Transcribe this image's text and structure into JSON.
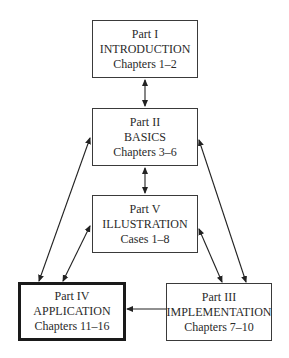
{
  "diagram": {
    "nodes": [
      {
        "id": "part1",
        "part": "Part I",
        "title": "INTRODUCTION",
        "range": "Chapters 1–2"
      },
      {
        "id": "part2",
        "part": "Part II",
        "title": "BASICS",
        "range": "Chapters 3–6"
      },
      {
        "id": "part5",
        "part": "Part V",
        "title": "ILLUSTRATION",
        "range": "Cases 1–8"
      },
      {
        "id": "part4",
        "part": "Part IV",
        "title": "APPLICATION",
        "range": "Chapters 11–16",
        "emphasized": true
      },
      {
        "id": "part3",
        "part": "Part III",
        "title": "IMPLEMENTATION",
        "range": "Chapters 7–10"
      }
    ],
    "edges": [
      {
        "from": "part1",
        "to": "part2",
        "bidirectional": true
      },
      {
        "from": "part2",
        "to": "part5",
        "bidirectional": true
      },
      {
        "from": "part2",
        "to": "part4",
        "bidirectional": true
      },
      {
        "from": "part5",
        "to": "part4",
        "bidirectional": true
      },
      {
        "from": "part2",
        "to": "part3",
        "bidirectional": true
      },
      {
        "from": "part5",
        "to": "part3",
        "bidirectional": true
      },
      {
        "from": "part3",
        "to": "part4",
        "bidirectional": false
      }
    ]
  }
}
